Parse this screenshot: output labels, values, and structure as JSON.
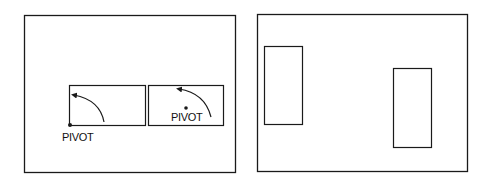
{
  "diagram": {
    "left_panel": {
      "boxes": [
        {
          "label": "PIVOT",
          "pivot_position": "bottom-left corner"
        },
        {
          "label": "PIVOT",
          "pivot_position": "center"
        }
      ]
    },
    "right_panel": {
      "rects": [
        {
          "orientation": "vertical",
          "position": "upper-left"
        },
        {
          "orientation": "vertical",
          "position": "lower-right"
        }
      ]
    },
    "colors": {
      "stroke": "#1a1a1a",
      "background": "#ffffff"
    }
  }
}
